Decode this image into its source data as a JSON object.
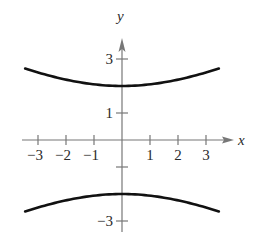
{
  "chart_data": {
    "type": "line",
    "title": "",
    "xlabel": "x",
    "ylabel": "y",
    "xlim": [
      -3.6,
      3.9
    ],
    "ylim": [
      -3.4,
      3.6
    ],
    "grid": false,
    "legend": null,
    "x_ticks": [
      -3,
      -2,
      -1,
      1,
      2,
      3
    ],
    "x_tick_labels": [
      "−3",
      "−2",
      "−1",
      "1",
      "2",
      "3"
    ],
    "y_ticks": [
      3,
      1,
      -1,
      -3
    ],
    "y_tick_labels": [
      "3",
      "1",
      "",
      "−3"
    ],
    "equation": "y^2/4 - x^2/16 = 1",
    "series": [
      {
        "name": "upper-branch",
        "color": "#111111",
        "x": [
          -3.46,
          -3,
          -2,
          -1,
          0,
          1,
          2,
          3,
          3.46
        ],
        "y": [
          2.64,
          2.5,
          2.24,
          2.06,
          2.0,
          2.06,
          2.24,
          2.5,
          2.64
        ]
      },
      {
        "name": "lower-branch",
        "color": "#111111",
        "x": [
          -3.46,
          -3,
          -2,
          -1,
          0,
          1,
          2,
          3,
          3.46
        ],
        "y": [
          -2.64,
          -2.5,
          -2.24,
          -2.06,
          -2.0,
          -2.06,
          -2.24,
          -2.5,
          -2.64
        ]
      }
    ]
  },
  "layout": {
    "origin_px": [
      122,
      140
    ],
    "unit_x_px": 28,
    "unit_y_px": 27,
    "axis_color": "#777777",
    "curve_color": "#111111"
  }
}
